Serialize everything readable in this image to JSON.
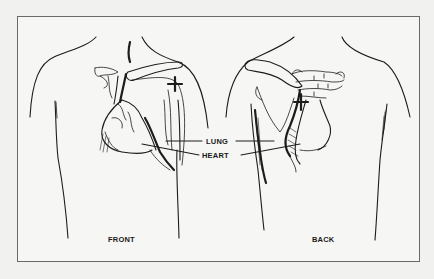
{
  "diagram": {
    "type": "anatomical illustration",
    "labels": {
      "lung": "LUNG",
      "heart": "HEART",
      "front": "FRONT",
      "back": "BACK"
    },
    "views": [
      {
        "name": "FRONT",
        "organs_shown": [
          "heart",
          "lung",
          "clavicle"
        ],
        "marker": "plus sign over upper right chest"
      },
      {
        "name": "BACK",
        "organs_shown": [
          "heart",
          "lung",
          "scapula",
          "spine"
        ],
        "marker": "plus sign near upper spine"
      }
    ],
    "leader_lines": [
      {
        "label": "LUNG",
        "targets": [
          "front lung",
          "back lung"
        ]
      },
      {
        "label": "HEART",
        "targets": [
          "front heart",
          "back heart"
        ]
      }
    ],
    "colors": {
      "background": "#f1f1ef",
      "panel": "#f6f6f4",
      "frame_border": "#6a6a6a",
      "ink": "#1c1c1c"
    }
  }
}
